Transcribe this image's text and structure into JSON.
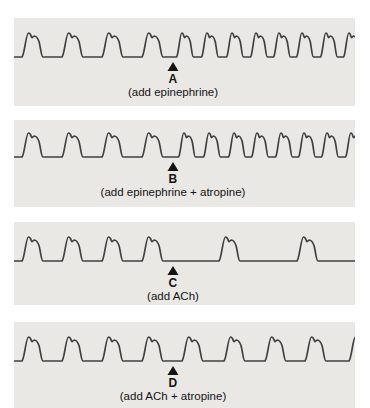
{
  "figure": {
    "colors": {
      "page_background": "#ffffff",
      "panel_background": "#e9e8e4",
      "trace": "#404040",
      "marker": "#141414",
      "text": "#141414"
    },
    "panels": [
      {
        "id": "A",
        "label": "A",
        "caption": "(add epinephrine)",
        "effect": "rate increases after marker",
        "arrow_x": 159,
        "baseline": 39,
        "amplitude": 24,
        "peaks": [
          {
            "x": 16,
            "w": 1
          },
          {
            "x": 56,
            "w": 1
          },
          {
            "x": 96,
            "w": 1
          },
          {
            "x": 136,
            "w": 1
          },
          {
            "x": 169,
            "w": 0.8
          },
          {
            "x": 194,
            "w": 0.8
          },
          {
            "x": 219,
            "w": 0.8
          },
          {
            "x": 243,
            "w": 0.8
          },
          {
            "x": 266,
            "w": 0.8
          },
          {
            "x": 289,
            "w": 0.8
          },
          {
            "x": 313,
            "w": 0.8
          },
          {
            "x": 336,
            "w": 0.8
          }
        ]
      },
      {
        "id": "B",
        "label": "B",
        "caption": "(add epinephrine + atropine)",
        "effect": "rate increases after marker",
        "arrow_x": 159,
        "baseline": 37,
        "amplitude": 24,
        "peaks": [
          {
            "x": 16,
            "w": 1
          },
          {
            "x": 56,
            "w": 1
          },
          {
            "x": 96,
            "w": 1
          },
          {
            "x": 136,
            "w": 1
          },
          {
            "x": 171,
            "w": 0.8
          },
          {
            "x": 196,
            "w": 0.8
          },
          {
            "x": 221,
            "w": 0.8
          },
          {
            "x": 244,
            "w": 0.8
          },
          {
            "x": 268,
            "w": 0.8
          },
          {
            "x": 291,
            "w": 0.8
          },
          {
            "x": 314,
            "w": 0.8
          },
          {
            "x": 338,
            "w": 0.8
          }
        ]
      },
      {
        "id": "C",
        "label": "C",
        "caption": "(add ACh)",
        "effect": "rate decreases after marker",
        "arrow_x": 159,
        "baseline": 39,
        "amplitude": 24,
        "peaks": [
          {
            "x": 16,
            "w": 1
          },
          {
            "x": 56,
            "w": 1
          },
          {
            "x": 96,
            "w": 1
          },
          {
            "x": 136,
            "w": 1
          },
          {
            "x": 213,
            "w": 1
          },
          {
            "x": 291,
            "w": 1
          }
        ]
      },
      {
        "id": "D",
        "label": "D",
        "caption": "(add ACh + atropine)",
        "effect": "rate unchanged after marker",
        "arrow_x": 159,
        "baseline": 39,
        "amplitude": 24,
        "peaks": [
          {
            "x": 16,
            "w": 1
          },
          {
            "x": 56,
            "w": 1
          },
          {
            "x": 96,
            "w": 1
          },
          {
            "x": 136,
            "w": 1
          },
          {
            "x": 176,
            "w": 1
          },
          {
            "x": 218,
            "w": 1
          },
          {
            "x": 259,
            "w": 1
          },
          {
            "x": 299,
            "w": 1
          },
          {
            "x": 343,
            "w": 1
          }
        ]
      }
    ]
  }
}
